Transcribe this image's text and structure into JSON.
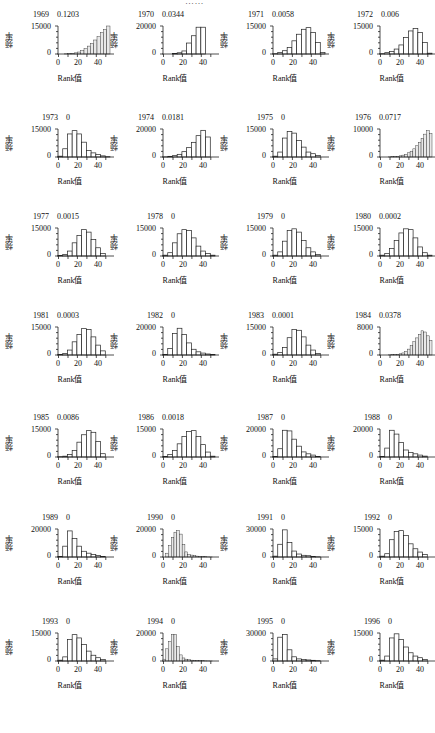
{
  "header": {
    "partial_text": "……"
  },
  "axis": {
    "xlabel": "Rank值",
    "ylabel": "频率",
    "xticks": [
      "0",
      "20",
      "40"
    ],
    "yzero": "0"
  },
  "chart_data": {
    "type": "bar",
    "layout": {
      "rows": 7,
      "cols": 4
    },
    "xlabel": "Rank值",
    "ylabel": "频率",
    "x_bins": [
      0,
      5,
      10,
      15,
      20,
      25,
      30,
      35,
      40,
      45,
      50
    ],
    "panels": [
      {
        "year": "1969",
        "value": "0.1203",
        "ymax_label": "15000",
        "ymax": 17000,
        "fine": true,
        "values": [
          0,
          0,
          100,
          200,
          400,
          700,
          1200,
          2000,
          3200,
          4800,
          6500,
          8500,
          10500,
          13000,
          15000,
          17000
        ]
      },
      {
        "year": "1970",
        "value": "0.0344",
        "ymax_label": "20000",
        "ymax": 23000,
        "fine": false,
        "values": [
          0,
          0,
          500,
          1000,
          2500,
          9000,
          15000,
          22000,
          22000,
          0
        ]
      },
      {
        "year": "1971",
        "value": "0.0058",
        "ymax_label": "15000",
        "ymax": 17000,
        "fine": false,
        "values": [
          200,
          1000,
          2000,
          4000,
          8000,
          12000,
          15000,
          16000,
          13000,
          7000,
          1000
        ]
      },
      {
        "year": "1972",
        "value": "0.006",
        "ymax_label": "15000",
        "ymax": 17000,
        "fine": false,
        "values": [
          200,
          800,
          1500,
          3000,
          5500,
          10000,
          14000,
          15500,
          13000,
          7000,
          500
        ]
      },
      {
        "year": "1973",
        "value": "0",
        "ymax_label": "15000",
        "ymax": 17000,
        "fine": false,
        "values": [
          500,
          5000,
          14000,
          16000,
          14000,
          9000,
          4000,
          2500,
          1500,
          700,
          200
        ]
      },
      {
        "year": "1974",
        "value": "0.0181",
        "ymax_label": "20000",
        "ymax": 21000,
        "fine": false,
        "values": [
          100,
          500,
          1000,
          2000,
          4000,
          7000,
          11000,
          16000,
          20000,
          15000
        ]
      },
      {
        "year": "1975",
        "value": "0",
        "ymax_label": "15000",
        "ymax": 17000,
        "fine": false,
        "values": [
          500,
          3000,
          11500,
          15500,
          14500,
          10000,
          6000,
          3000,
          2000,
          1000
        ]
      },
      {
        "year": "1976",
        "value": "0.0717",
        "ymax_label": "10000",
        "ymax": 12000,
        "fine": true,
        "values": [
          0,
          0,
          0,
          50,
          100,
          200,
          300,
          500,
          800,
          1200,
          1800,
          2500,
          3500,
          4800,
          6200,
          8000,
          9800,
          11300,
          10000
        ]
      },
      {
        "year": "1977",
        "value": "0.0015",
        "ymax_label": "15000",
        "ymax": 17000,
        "fine": false,
        "values": [
          300,
          1000,
          3000,
          8000,
          12500,
          16000,
          14500,
          10000,
          5000,
          1500
        ]
      },
      {
        "year": "1978",
        "value": "0",
        "ymax_label": "15000",
        "ymax": 17000,
        "fine": false,
        "values": [
          500,
          2000,
          8000,
          13500,
          16000,
          15500,
          11000,
          6000,
          3000,
          1500,
          500
        ]
      },
      {
        "year": "1979",
        "value": "0",
        "ymax_label": "15000",
        "ymax": 17000,
        "fine": false,
        "values": [
          500,
          2500,
          9000,
          15500,
          16500,
          14500,
          9500,
          5000,
          2500,
          1000
        ]
      },
      {
        "year": "1980",
        "value": "0.0002",
        "ymax_label": "15000",
        "ymax": 17000,
        "fine": false,
        "values": [
          500,
          1500,
          4500,
          9500,
          14000,
          16500,
          16000,
          11000,
          5500,
          2000,
          500
        ]
      },
      {
        "year": "1981",
        "value": "0.0003",
        "ymax_label": "15000",
        "ymax": 17000,
        "fine": false,
        "values": [
          300,
          1000,
          3000,
          8000,
          12500,
          16000,
          15500,
          11000,
          6000,
          2500
        ]
      },
      {
        "year": "1982",
        "value": "0",
        "ymax_label": "20000",
        "ymax": 22000,
        "fine": false,
        "values": [
          500,
          5000,
          17000,
          21000,
          16000,
          9500,
          4500,
          2500,
          1500,
          800,
          300
        ]
      },
      {
        "year": "1983",
        "value": "0.0001",
        "ymax_label": "15000",
        "ymax": 17000,
        "fine": false,
        "values": [
          500,
          1500,
          4500,
          10500,
          15500,
          15000,
          11000,
          6000,
          3000,
          1000
        ]
      },
      {
        "year": "1984",
        "value": "0.0378",
        "ymax_label": "8000",
        "ymax": 9500,
        "fine": true,
        "values": [
          0,
          0,
          0,
          50,
          100,
          150,
          250,
          400,
          700,
          1200,
          2000,
          3200,
          4500,
          5800,
          7000,
          8200,
          7800,
          6500,
          5000
        ]
      },
      {
        "year": "1985",
        "value": "0.0086",
        "ymax_label": "15000",
        "ymax": 17000,
        "fine": false,
        "values": [
          200,
          500,
          1500,
          4000,
          9000,
          13500,
          16000,
          15000,
          9500,
          2000
        ]
      },
      {
        "year": "1986",
        "value": "0.0018",
        "ymax_label": "15000",
        "ymax": 17000,
        "fine": false,
        "values": [
          300,
          1500,
          4000,
          8000,
          12500,
          15500,
          16000,
          12500,
          7500,
          3000,
          500
        ]
      },
      {
        "year": "1987",
        "value": "0",
        "ymax_label": "20000",
        "ymax": 22000,
        "fine": false,
        "values": [
          500,
          6500,
          21000,
          20500,
          14000,
          8500,
          4000,
          2500,
          1500,
          500
        ]
      },
      {
        "year": "1988",
        "value": "0",
        "ymax_label": "20000",
        "ymax": 22000,
        "fine": false,
        "values": [
          500,
          7000,
          21000,
          18000,
          11500,
          5500,
          3500,
          2500,
          1500,
          700
        ]
      },
      {
        "year": "1989",
        "value": "0",
        "ymax_label": "20000",
        "ymax": 22000,
        "fine": false,
        "values": [
          500,
          8500,
          20500,
          14500,
          8500,
          4500,
          3000,
          2000,
          1200,
          500
        ]
      },
      {
        "year": "1990",
        "value": "0",
        "ymax_label": "20000",
        "ymax": 22000,
        "fine": true,
        "values": [
          0,
          3000,
          9000,
          15500,
          19500,
          21000,
          18000,
          10000,
          4000,
          2000,
          1500,
          1000,
          700,
          500,
          300,
          200,
          100,
          50,
          0
        ]
      },
      {
        "year": "1991",
        "value": "0",
        "ymax_label": "30000",
        "ymax": 33000,
        "fine": false,
        "values": [
          1000,
          15000,
          32000,
          17000,
          7000,
          3500,
          2000,
          1500,
          700,
          200
        ]
      },
      {
        "year": "1992",
        "value": "0",
        "ymax_label": "15000",
        "ymax": 17000,
        "fine": false,
        "values": [
          500,
          2000,
          10500,
          15500,
          16000,
          13000,
          8000,
          5000,
          3000,
          1500
        ]
      },
      {
        "year": "1993",
        "value": "0",
        "ymax_label": "15000",
        "ymax": 17000,
        "fine": false,
        "values": [
          500,
          2500,
          13000,
          16000,
          14000,
          10000,
          6000,
          3500,
          2000,
          1000
        ]
      },
      {
        "year": "1994",
        "value": "0",
        "ymax_label": "20000",
        "ymax": 23000,
        "fine": true,
        "values": [
          1500,
          10000,
          16000,
          22000,
          22000,
          12000,
          5000,
          2500,
          1500,
          1000,
          700,
          500,
          400,
          300,
          200,
          150,
          100,
          50,
          0
        ]
      },
      {
        "year": "1995",
        "value": "0",
        "ymax_label": "30000",
        "ymax": 40000,
        "fine": false,
        "values": [
          3000,
          34000,
          38000,
          16000,
          6000,
          3000,
          2000,
          1500,
          1000,
          500
        ]
      },
      {
        "year": "1996",
        "value": "0",
        "ymax_label": "15000",
        "ymax": 17000,
        "fine": false,
        "values": [
          500,
          3000,
          14000,
          16500,
          13000,
          8500,
          5000,
          3000,
          2000,
          1000
        ]
      }
    ]
  }
}
